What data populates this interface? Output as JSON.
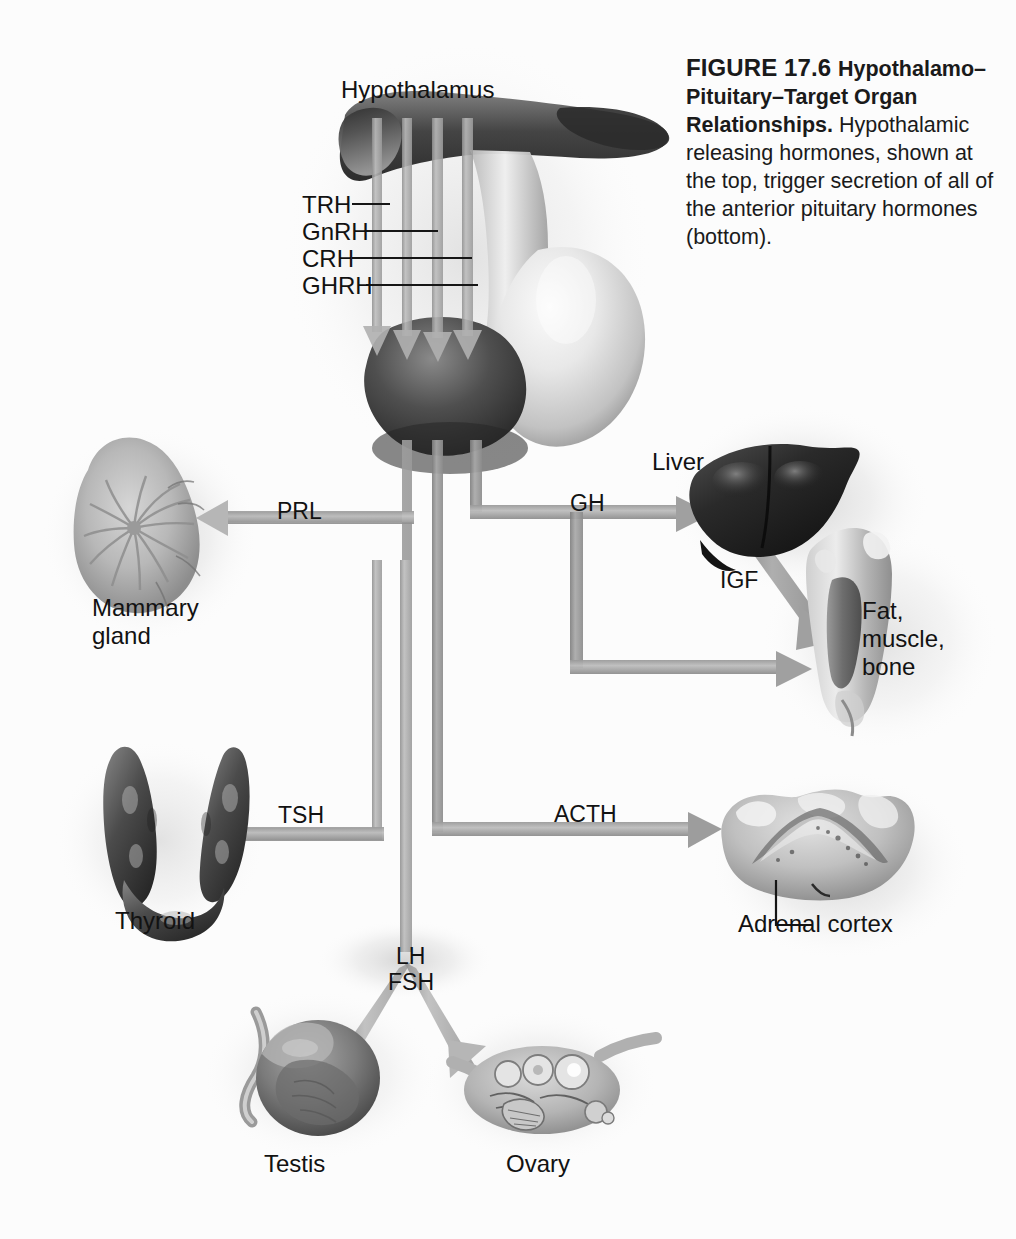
{
  "figure": {
    "number": "FIGURE 17.6",
    "title": "Hypothalamo–Pituitary–Target Organ Relationships.",
    "body": " Hypothalamic releasing hormones, shown at the top, trigger secretion of all of the anterior pituitary hormones (bottom)."
  },
  "colors": {
    "background": "#fcfcfc",
    "text": "#121212",
    "arrow_light": "#b4b4b4",
    "arrow_mid": "#9d9d9d",
    "arrow_dark": "#8a8a8a",
    "leader_line": "#161616",
    "organ_dark": "#3a3a3a",
    "organ_mid": "#8d8d8d",
    "organ_light": "#d8d8d8"
  },
  "structures": {
    "hypothalamus": "Hypothalamus",
    "mammary_gland": "Mammary\ngland",
    "thyroid": "Thyroid",
    "testis": "Testis",
    "ovary": "Ovary",
    "liver": "Liver",
    "fat_muscle_bone": "Fat,\nmuscle,\nbone",
    "adrenal_cortex": "Adrenal cortex"
  },
  "releasing_hormones": [
    {
      "id": "trh",
      "label": "TRH",
      "leader_length": 38
    },
    {
      "id": "gnrh",
      "label": "GnRH",
      "leader_length": 72
    },
    {
      "id": "crh",
      "label": "CRH",
      "leader_length": 120
    },
    {
      "id": "ghrh",
      "label": "GHRH",
      "leader_length": 150
    }
  ],
  "pituitary_hormones": [
    {
      "id": "prl",
      "label": "PRL",
      "target": "Mammary gland"
    },
    {
      "id": "tsh",
      "label": "TSH",
      "target": "Thyroid"
    },
    {
      "id": "lh",
      "label": "LH",
      "target": "Testis, Ovary"
    },
    {
      "id": "fsh",
      "label": "FSH",
      "target": "Testis, Ovary"
    },
    {
      "id": "acth",
      "label": "ACTH",
      "target": "Adrenal cortex"
    },
    {
      "id": "gh",
      "label": "GH",
      "target": "Liver; Fat, muscle, bone"
    }
  ],
  "secondary_hormones": [
    {
      "id": "igf",
      "label": "IGF",
      "source": "Liver",
      "target": "Fat, muscle, bone"
    }
  ],
  "labels": {
    "hypothalamus": "Hypothalamus",
    "trh": "TRH",
    "gnrh": "GnRH",
    "crh": "CRH",
    "ghrh": "GHRH",
    "prl": "PRL",
    "gh": "GH",
    "igf": "IGF",
    "tsh": "TSH",
    "acth": "ACTH",
    "lh": "LH",
    "fsh": "FSH",
    "liver": "Liver",
    "fat_muscle_bone_1": "Fat,",
    "fat_muscle_bone_2": "muscle,",
    "fat_muscle_bone_3": "bone",
    "mammary_1": "Mammary",
    "mammary_2": "gland",
    "thyroid": "Thyroid",
    "adrenal_cortex": "Adrenal cortex",
    "testis": "Testis",
    "ovary": "Ovary"
  }
}
